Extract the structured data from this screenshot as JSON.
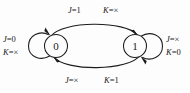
{
  "diagram": {
    "type": "state-transition-diagram",
    "background_color": "#fdfdfd",
    "stroke_color": "#1c1c1c",
    "states": [
      {
        "id": "state0",
        "label": "0",
        "cx": 56,
        "cy": 46,
        "r": 11.5
      },
      {
        "id": "state1",
        "label": "1",
        "cx": 135,
        "cy": 46,
        "r": 11.5
      }
    ],
    "transitions": [
      {
        "id": "self-loop-0",
        "from": "0",
        "to": "0",
        "kind": "self-loop",
        "label_position": "left",
        "conditions": [
          {
            "var": "J",
            "eq": "=",
            "value": "0",
            "text": "J=0"
          },
          {
            "var": "K",
            "eq": "=",
            "value": "×",
            "text": "K=×"
          }
        ]
      },
      {
        "id": "arc-0-to-1",
        "from": "0",
        "to": "1",
        "kind": "arc-top",
        "label_position": "top",
        "conditions": [
          {
            "var": "J",
            "eq": "=",
            "value": "1",
            "text": "J=1"
          },
          {
            "var": "K",
            "eq": "=",
            "value": "×",
            "text": "K=×"
          }
        ]
      },
      {
        "id": "arc-1-to-0",
        "from": "1",
        "to": "0",
        "kind": "arc-bottom",
        "label_position": "bottom",
        "conditions": [
          {
            "var": "J",
            "eq": "=",
            "value": "×",
            "text": "J=×"
          },
          {
            "var": "K",
            "eq": "=",
            "value": "1",
            "text": "K=1"
          }
        ]
      },
      {
        "id": "self-loop-1",
        "from": "1",
        "to": "1",
        "kind": "self-loop",
        "label_position": "right",
        "conditions": [
          {
            "var": "J",
            "eq": "=",
            "value": "×",
            "text": "J=×"
          },
          {
            "var": "K",
            "eq": "=",
            "value": "0",
            "text": "K=0"
          }
        ]
      }
    ],
    "labels": {
      "state0_text": "0",
      "state1_text": "1",
      "left_j": "J",
      "left_j_val": "=0",
      "left_k": "K",
      "left_k_val": "=×",
      "top_j": "J",
      "top_j_val": "=1",
      "top_k": "K",
      "top_k_val": "=×",
      "bottom_j": "J",
      "bottom_j_val": "=×",
      "bottom_k": "K",
      "bottom_k_val": "=1",
      "right_j": "J",
      "right_j_val": "=×",
      "right_k": "K",
      "right_k_val": "=0"
    }
  }
}
